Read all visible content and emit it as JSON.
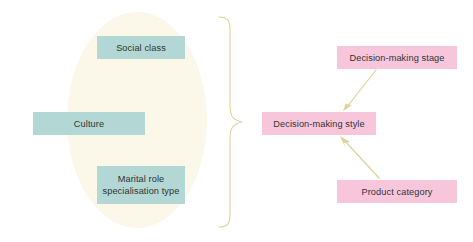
{
  "diagram": {
    "colors": {
      "ellipse_fill": "#fbf8e9",
      "node_teal": "#b2d7d4",
      "node_pink": "#f8c6db",
      "connector": "#ddd19c",
      "text": "#2f3436",
      "background": "#ffffff"
    },
    "grouping_ellipse": {
      "label": "antecedent-variables-group",
      "cx": 137,
      "cy": 120,
      "rx": 70,
      "ry": 108
    },
    "brace": {
      "label": "grouping-brace",
      "orientation": "right-pointing",
      "top": 16,
      "bottom": 228,
      "tip_x": 243,
      "tip_y": 122
    },
    "left_nodes": [
      {
        "id": "social-class",
        "label": "Social class",
        "style": "teal"
      },
      {
        "id": "culture",
        "label": "Culture",
        "style": "teal"
      },
      {
        "id": "marital-role",
        "label": "Marital role\nspecialisation type",
        "line1": "Marital role",
        "line2": "specialisation type",
        "style": "teal"
      }
    ],
    "right_nodes": [
      {
        "id": "decision-making-stage",
        "label": "Decision-making stage",
        "style": "pink"
      },
      {
        "id": "decision-making-style",
        "label": "Decision-making style",
        "style": "pink"
      },
      {
        "id": "product-category",
        "label": "Product category",
        "style": "pink"
      }
    ],
    "arrows": [
      {
        "id": "arrow-stage-to-style",
        "from": "decision-making-stage",
        "to": "decision-making-style",
        "direction": "down-left"
      },
      {
        "id": "arrow-product-to-style",
        "from": "product-category",
        "to": "decision-making-style",
        "direction": "up-left"
      }
    ]
  }
}
